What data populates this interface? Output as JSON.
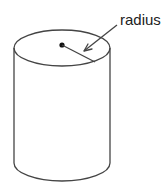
{
  "diagram": {
    "shape": "cylinder",
    "labels": {
      "radius": "radius"
    },
    "colors": {
      "stroke": "#444444",
      "text": "#222222",
      "background": "#ffffff"
    }
  }
}
